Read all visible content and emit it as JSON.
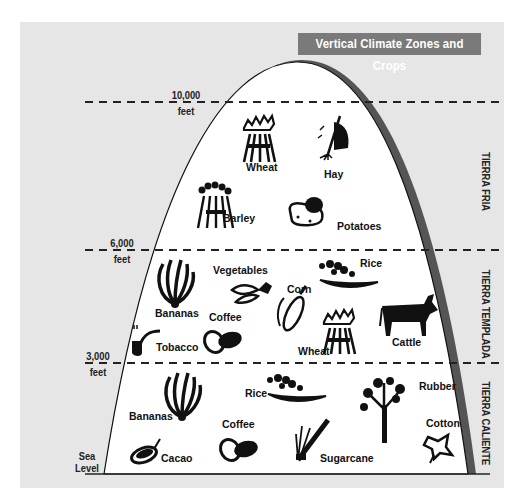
{
  "title": "Vertical Climate Zones and Crops",
  "altitudes": [
    {
      "value": "10,000",
      "unit": "feet"
    },
    {
      "value": "6,000",
      "unit": "feet"
    },
    {
      "value": "3,000",
      "unit": "feet"
    },
    {
      "value": "Sea",
      "unit": "Level"
    }
  ],
  "zones": [
    {
      "name": "TIERRA FRIA",
      "range": "6,000–10,000 feet",
      "crops": [
        "Wheat",
        "Hay",
        "Barley",
        "Potatoes"
      ]
    },
    {
      "name": "TIERRA TEMPLADA",
      "range": "3,000–6,000 feet",
      "crops": [
        "Bananas",
        "Vegetables",
        "Corn",
        "Rice",
        "Coffee",
        "Tobacco",
        "Wheat",
        "Cattle"
      ]
    },
    {
      "name": "TIERRA CALIENTE",
      "range": "Sea Level–3,000 feet",
      "crops": [
        "Bananas",
        "Rice",
        "Rubber",
        "Coffee",
        "Cacao",
        "Sugarcane",
        "Cotton"
      ]
    }
  ],
  "colors": {
    "panel": "#e6e6e6",
    "title_bg": "#7a7a7a",
    "mountain_shadow": "#555555"
  }
}
